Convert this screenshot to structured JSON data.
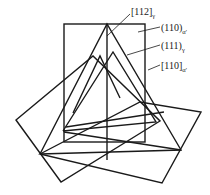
{
  "figure": {
    "labels": [
      {
        "id": "dir-112-gamma",
        "main": "[112]",
        "sub": "γ"
      },
      {
        "id": "plane-110-alpha",
        "main": "(110)",
        "sub": "α'"
      },
      {
        "id": "plane-111-gamma",
        "main": "(111)",
        "sub": "γ"
      },
      {
        "id": "dir-110-alpha",
        "main": "[110]",
        "sub": "α'"
      }
    ],
    "line_color": "#1a1a1a",
    "background": "#ffffff"
  }
}
